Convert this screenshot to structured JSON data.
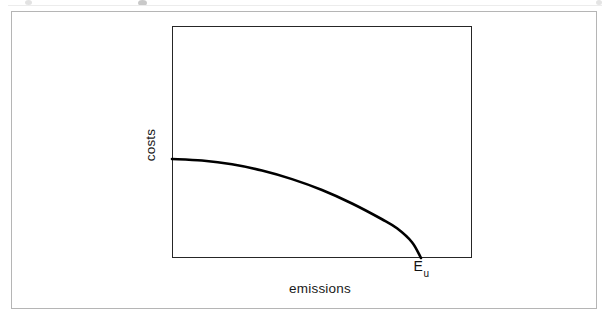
{
  "figure": {
    "background_color": "#ffffff",
    "frame_color": "#b5b5b5",
    "plot_border_color": "#262626",
    "curve_color": "#000000"
  },
  "axes": {
    "ylabel": "costs",
    "xlabel": "emissions"
  },
  "annotations": {
    "x_intercept_label_base": "E",
    "x_intercept_label_sub": "u"
  },
  "chart_data": {
    "type": "line",
    "title": "",
    "xlabel": "emissions",
    "ylabel": "costs",
    "grid": false,
    "legend": null,
    "axis_ticks": {
      "x": [],
      "y": []
    },
    "xlim": [
      0,
      1
    ],
    "ylim": [
      0,
      1
    ],
    "annotations": [
      {
        "text": "E_u",
        "display": "E",
        "subscript": "u",
        "x": 0.83,
        "y": 0,
        "position": "below-axis",
        "meaning": "unregulated emissions level where marginal abatement cost reaches zero"
      }
    ],
    "series": [
      {
        "name": "marginal abatement cost",
        "description": "decreasing concave curve from a positive cost intercept, falling to zero at E_u on the emissions axis",
        "x": [
          0.0,
          0.1,
          0.2,
          0.3,
          0.4,
          0.5,
          0.6,
          0.7,
          0.75,
          0.8,
          0.83
        ],
        "y": [
          0.427,
          0.42,
          0.404,
          0.377,
          0.34,
          0.293,
          0.235,
          0.167,
          0.128,
          0.068,
          0.0
        ]
      }
    ]
  }
}
